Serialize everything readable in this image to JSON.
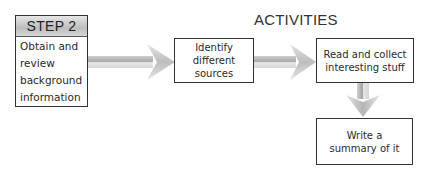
{
  "diagram": {
    "section_title": "ACTIVITIES",
    "step": {
      "label": "STEP 2",
      "description_lines": [
        "Obtain and",
        "review",
        "background",
        "information"
      ]
    },
    "activities": [
      {
        "lines": [
          "Identify different",
          "sources"
        ]
      },
      {
        "lines": [
          "Read and collect",
          "interesting stuff"
        ]
      },
      {
        "lines": [
          "Write a",
          "summary of it"
        ]
      }
    ],
    "arrows": [
      {
        "from": "STEP 2",
        "to": "Identify different sources",
        "direction": "right"
      },
      {
        "from": "Identify different sources",
        "to": "Read and collect interesting stuff",
        "direction": "right"
      },
      {
        "from": "Read and collect interesting stuff",
        "to": "Write a summary of it",
        "direction": "down"
      }
    ],
    "colors": {
      "arrow_light": "#e2e2e2",
      "arrow_dark": "#9a9a9a",
      "header_band": "#c8c8c8",
      "border": "#333333"
    }
  }
}
